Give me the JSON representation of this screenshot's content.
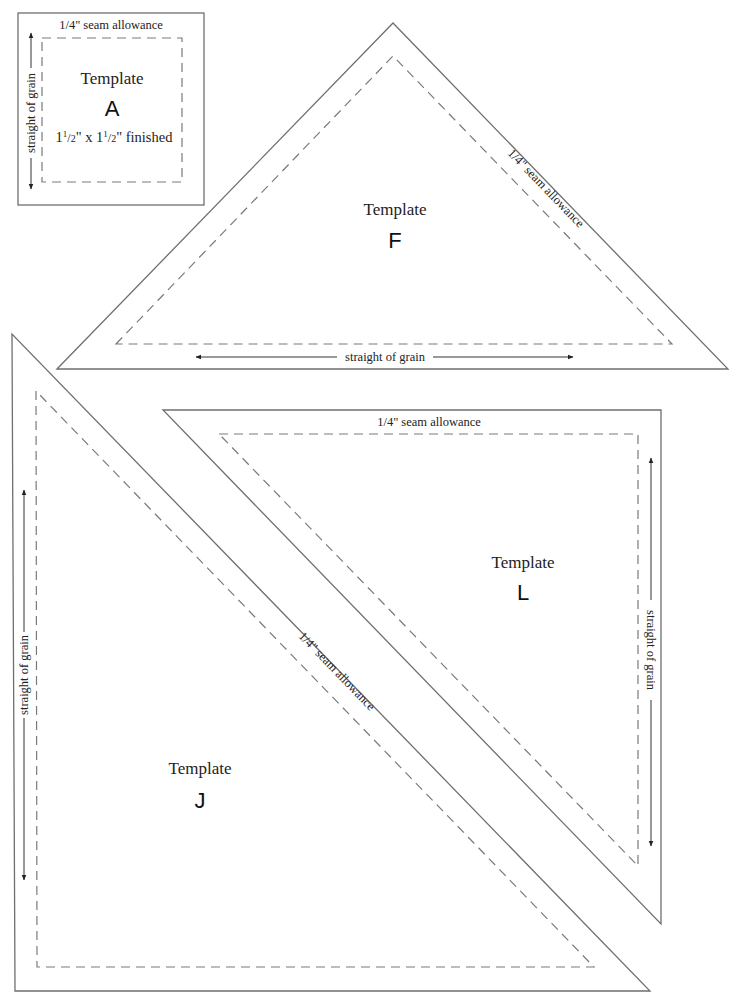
{
  "templates": {
    "A": {
      "title": "Template",
      "letter": "A",
      "seam_label": "1/4\" seam allowance",
      "grain_label": "straight of grain",
      "size_whole_1": "1",
      "size_frac_num_1": "1",
      "size_frac_den_1": "2",
      "size_mid": "\" x ",
      "size_whole_2": "1",
      "size_frac_num_2": "1",
      "size_frac_den_2": "2",
      "size_suffix": "\" finished"
    },
    "F": {
      "title": "Template",
      "letter": "F",
      "seam_label": "1/4\" seam allowance",
      "grain_label": "straight of grain"
    },
    "J": {
      "title": "Template",
      "letter": "J",
      "seam_label": "1/4\" seam allowance",
      "grain_label": "straight of grain"
    },
    "L": {
      "title": "Template",
      "letter": "L",
      "seam_label": "1/4\" seam allowance",
      "grain_label": "straight of grain"
    }
  },
  "colors": {
    "cut_line": "#6f6f6f",
    "sew_line": "#7a7a7a",
    "text": "#222222",
    "background": "#ffffff"
  }
}
